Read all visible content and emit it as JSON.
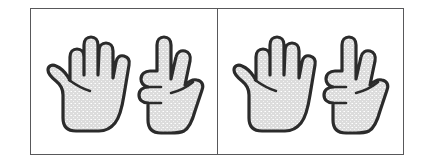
{
  "figure": {
    "background_color": "#ffffff",
    "frame": {
      "border_color": "#58585a",
      "fill_color": "#ffffff",
      "divider_color": "#58585a"
    },
    "hand_style": {
      "fill_color": "#dcdcdc",
      "speckle_color": "#ffffff",
      "outline_color": "#2b2b2b"
    },
    "panels": [
      {
        "name": "left-panel",
        "hands": [
          {
            "name": "open-hand",
            "icon": "hand-open-five-fingers-icon",
            "fingers_extended": 5,
            "orientation": "palm-facing-viewer",
            "thumb_side": "left"
          },
          {
            "name": "two-finger-hand",
            "icon": "hand-two-fingers-icon",
            "fingers_extended": 2,
            "orientation": "palm-facing-viewer",
            "thumb_side": "right"
          }
        ],
        "count_total": 7
      },
      {
        "name": "right-panel",
        "hands": [
          {
            "name": "open-hand",
            "icon": "hand-open-five-fingers-icon",
            "fingers_extended": 5,
            "orientation": "palm-facing-viewer",
            "thumb_side": "left"
          },
          {
            "name": "two-finger-hand",
            "icon": "hand-two-fingers-icon",
            "fingers_extended": 2,
            "orientation": "palm-facing-viewer",
            "thumb_side": "right"
          }
        ],
        "count_total": 7
      }
    ]
  }
}
